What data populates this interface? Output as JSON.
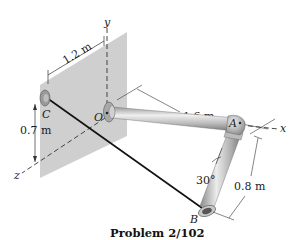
{
  "figure": {
    "caption": "Problem 2/102",
    "colors": {
      "wall": "#cfcfcf",
      "pipe_light": "#e4e4e4",
      "pipe_dark": "#8a8a8a",
      "cable": "#111111",
      "axis": "#333333"
    }
  },
  "axes": {
    "x": "x",
    "y": "y",
    "z": "z"
  },
  "points": {
    "O": "O",
    "A": "A",
    "B": "B",
    "C": "C"
  },
  "dimensions": {
    "wall_width": "1.2 m",
    "c_height": "0.7 m",
    "oa_length": "1.6 m",
    "ab_length": "0.8 m",
    "angle": "30°"
  }
}
